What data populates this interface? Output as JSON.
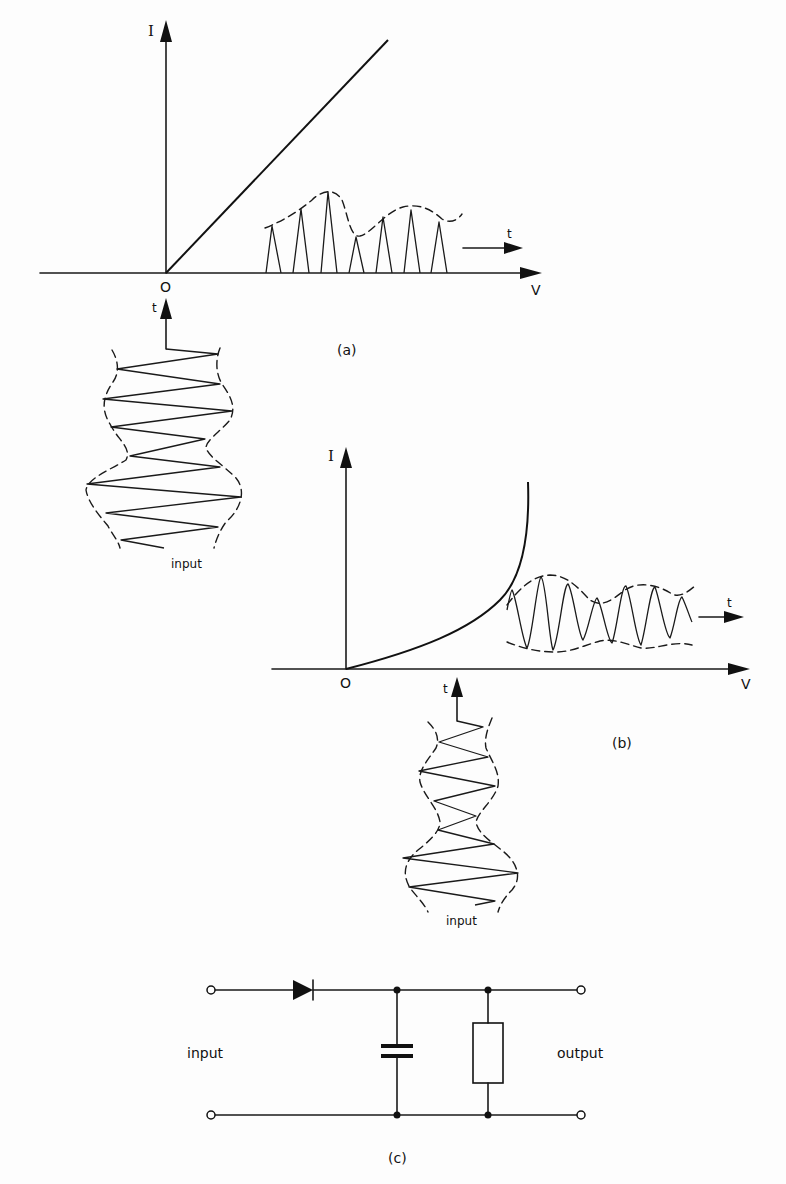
{
  "figure": {
    "panel_a": {
      "caption": "(a)",
      "axis_y_label": "I",
      "axis_x_label": "V",
      "origin_label": "O",
      "output_time_label": "t",
      "input_time_label": "t",
      "input_label": "input",
      "characteristic": "linear"
    },
    "panel_b": {
      "caption": "(b)",
      "axis_y_label": "I",
      "axis_x_label": "V",
      "origin_label": "O",
      "output_time_label": "t",
      "input_time_label": "t",
      "input_label": "input",
      "characteristic": "exponential"
    },
    "panel_c": {
      "caption": "(c)",
      "input_label": "input",
      "output_label": "output",
      "components": [
        "diode",
        "capacitor",
        "resistor"
      ]
    }
  }
}
